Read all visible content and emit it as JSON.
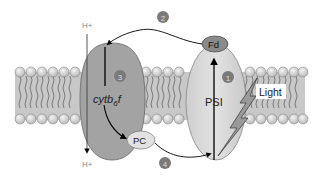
{
  "diagram": {
    "labels": {
      "h_plus_top": "H+",
      "h_plus_bottom": "H+",
      "cytb6f": "cytb",
      "cytb6f_sub": "6",
      "cytb6f_suffix": "f",
      "psi": "PSI",
      "fd": "Fd",
      "pc": "PC",
      "light": "Light"
    },
    "steps": [
      {
        "number": "1",
        "position": "inside PSI"
      },
      {
        "number": "2",
        "position": "top, Fd to cytb6f arrow"
      },
      {
        "number": "3",
        "position": "inside cytb6f"
      },
      {
        "number": "4",
        "position": "bottom, PC to PSI arrow"
      }
    ],
    "colors": {
      "membrane_fill": "#c8c8c8",
      "lipid_head": "#e6e6e6",
      "cytb6f_fill": "#a3a3a3",
      "psi_fill": "#d9d9d9",
      "fd_fill": "#8a8a8a",
      "pc_fill": "#e2e2e2",
      "step_badge": "#7a7a7a",
      "lightning_fill": "#9a9a9a"
    }
  }
}
